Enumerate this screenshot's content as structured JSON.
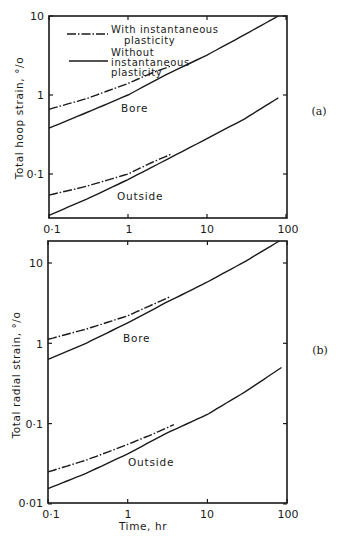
{
  "chart_data": [
    {
      "type": "line",
      "panel": "(a)",
      "title": "",
      "xlabel": "",
      "ylabel": "Total hoop strain, °/o",
      "xscale": "log",
      "yscale": "log",
      "xlim": [
        0.1,
        100
      ],
      "ylim": [
        0.028,
        10
      ],
      "xticks": [
        "0·1",
        "1",
        "10",
        "100"
      ],
      "yticks": [
        "0·1",
        "1",
        "10"
      ],
      "grid": false,
      "legend": {
        "position": "upper left",
        "entries": [
          {
            "style": "dash-dot",
            "label": "With instantaneous plasticity"
          },
          {
            "style": "solid",
            "label": "Without instantaneous plasticity"
          }
        ]
      },
      "annotations": [
        "Bore",
        "Outside"
      ],
      "series": [
        {
          "name": "Bore - with instantaneous plasticity",
          "style": "dash-dot",
          "x": [
            0.1,
            0.3,
            1,
            2,
            3.4
          ],
          "y": [
            0.66,
            0.9,
            1.4,
            1.9,
            2.3
          ]
        },
        {
          "name": "Bore - without instantaneous plasticity",
          "style": "solid",
          "x": [
            0.1,
            0.3,
            1,
            3,
            10,
            30,
            80
          ],
          "y": [
            0.38,
            0.6,
            1.0,
            1.8,
            3.2,
            5.8,
            10
          ]
        },
        {
          "name": "Outside - with instantaneous plasticity",
          "style": "dash-dot",
          "x": [
            0.1,
            0.3,
            1,
            2,
            3.6
          ],
          "y": [
            0.054,
            0.07,
            0.1,
            0.14,
            0.18
          ]
        },
        {
          "name": "Outside - without instantaneous plasticity",
          "style": "solid",
          "x": [
            0.1,
            0.3,
            1,
            3,
            10,
            30,
            80
          ],
          "y": [
            0.03,
            0.048,
            0.085,
            0.15,
            0.28,
            0.5,
            0.92
          ]
        }
      ]
    },
    {
      "type": "line",
      "panel": "(b)",
      "title": "",
      "xlabel": "Time, hr",
      "ylabel": "Total radial strain, °/o",
      "xscale": "log",
      "yscale": "log",
      "xlim": [
        0.1,
        100
      ],
      "ylim": [
        0.01,
        19
      ],
      "xticks": [
        "0·1",
        "1",
        "10",
        "100"
      ],
      "yticks": [
        "0·01",
        "0·1",
        "1",
        "10"
      ],
      "grid": false,
      "annotations": [
        "Bore",
        "Outside"
      ],
      "series": [
        {
          "name": "Bore - with instantaneous plasticity",
          "style": "dash-dot",
          "x": [
            0.1,
            0.3,
            1,
            2,
            3.4
          ],
          "y": [
            1.12,
            1.5,
            2.2,
            3.0,
            3.8
          ]
        },
        {
          "name": "Bore - without instantaneous plasticity",
          "style": "solid",
          "x": [
            0.1,
            0.3,
            1,
            3,
            10,
            30,
            80
          ],
          "y": [
            0.63,
            1.0,
            1.8,
            3.2,
            5.8,
            10.5,
            18.8
          ]
        },
        {
          "name": "Outside - with instantaneous plasticity",
          "style": "dash-dot",
          "x": [
            0.1,
            0.3,
            1,
            2,
            3.8
          ],
          "y": [
            0.025,
            0.035,
            0.055,
            0.073,
            0.097
          ]
        },
        {
          "name": "Outside - without instantaneous plasticity",
          "style": "solid",
          "x": [
            0.1,
            0.3,
            1,
            3,
            10,
            30,
            85
          ],
          "y": [
            0.0155,
            0.024,
            0.042,
            0.075,
            0.13,
            0.25,
            0.5
          ]
        }
      ]
    }
  ],
  "figure": {
    "panel_a_label": "(a)",
    "panel_b_label": "(b)",
    "a_ylabel": "Total hoop strain, °/o",
    "b_ylabel": "Total radial strain, °/o",
    "xlabel": "Time, hr",
    "xtick_labels": [
      "0·1",
      "1",
      "10",
      "100"
    ],
    "a_ytick_labels": [
      "10",
      "1",
      "0·1"
    ],
    "b_ytick_labels": [
      "10",
      "1",
      "0·1",
      "0·01"
    ],
    "legend_line1_a": "With instantaneous",
    "legend_line1_b": "plasticity",
    "legend_line2_a": "Without",
    "legend_line2_b": "instantaneous",
    "legend_line2_c": "plasticity",
    "bore_label": "Bore",
    "outside_label": "Outside"
  }
}
